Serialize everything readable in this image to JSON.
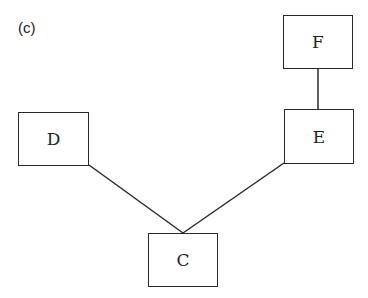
{
  "figure": {
    "panel_label": "(c)"
  },
  "nodes": [
    {
      "id": "F",
      "label": "F",
      "x": 283,
      "y": 15,
      "w": 70,
      "h": 54
    },
    {
      "id": "E",
      "label": "E",
      "x": 284,
      "y": 109,
      "w": 70,
      "h": 55
    },
    {
      "id": "D",
      "label": "D",
      "x": 18,
      "y": 112,
      "w": 71,
      "h": 54
    },
    {
      "id": "C",
      "label": "C",
      "x": 148,
      "y": 233,
      "w": 70,
      "h": 54
    }
  ],
  "edges": [
    {
      "from": "F",
      "to": "E"
    },
    {
      "from": "D",
      "to": "C"
    },
    {
      "from": "E",
      "to": "C"
    }
  ]
}
